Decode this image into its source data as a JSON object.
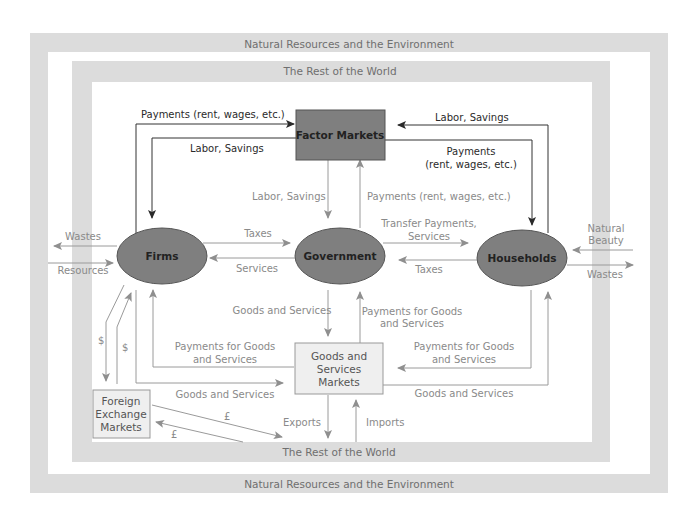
{
  "diagram": {
    "outer_frame": {
      "label_top": "Natural Resources and the Environment",
      "label_bottom": "Natural Resources and the Environment"
    },
    "inner_frame": {
      "label_top": "The Rest of the World",
      "label_bottom": "The Rest of the World"
    },
    "nodes": {
      "factor_markets": "Factor Markets",
      "firms": "Firms",
      "government": "Government",
      "households": "Households",
      "goods_markets": [
        "Goods and",
        "Services",
        "Markets"
      ],
      "fx_markets": [
        "Foreign",
        "Exchange",
        "Markets"
      ]
    },
    "flows": {
      "firms_to_factor_payments": "Payments (rent, wages, etc.)",
      "factor_to_firms_labor": "Labor, Savings",
      "households_to_factor_labor": "Labor, Savings",
      "factor_to_households_payments": [
        "Payments",
        "(rent, wages, etc.)"
      ],
      "factor_to_gov_labor": "Labor, Savings",
      "gov_to_factor_payments": "Payments (rent, wages, etc.)",
      "firms_to_gov_taxes": "Taxes",
      "gov_to_firms_services": "Services",
      "gov_to_households_transfer": [
        "Transfer Payments,",
        "Services"
      ],
      "households_to_gov_taxes": "Taxes",
      "firms_wastes": "Wastes",
      "firms_resources": "Resources",
      "households_natural_beauty": [
        "Natural",
        "Beauty"
      ],
      "households_wastes": "Wastes",
      "gov_goods_and_services": "Goods and Services",
      "market_to_gov_payments": [
        "Payments for Goods",
        "and Services"
      ],
      "market_to_firms_payments": [
        "Payments for Goods",
        "and Services"
      ],
      "firms_goods_and_services": "Goods and Services",
      "households_to_market_payments": [
        "Payments for Goods",
        "and Services"
      ],
      "market_to_households_goods": "Goods and Services",
      "exports": "Exports",
      "imports": "Imports",
      "dollar_1": "$",
      "dollar_2": "$",
      "pound_1": "£",
      "pound_2": "£"
    },
    "colors": {
      "frame_grey": "#dcdcdc",
      "node_fill": "#7f7f7f",
      "box_fill": "#efefef",
      "dark_line": "#333333",
      "grey_line": "#9a9a9a"
    }
  }
}
